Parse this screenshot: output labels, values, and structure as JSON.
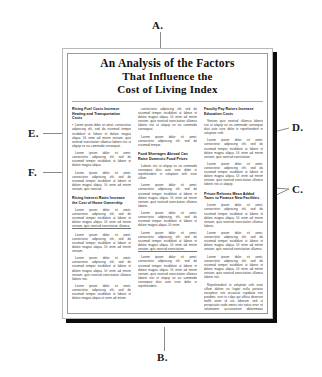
{
  "document": {
    "masthead": {
      "line1": "An Analysis of the Factors",
      "line2": "That Influence the",
      "line3": "Cost of Living Index"
    },
    "columns": [
      {
        "name": "left-column",
        "blocks": [
          {
            "heading": "Rising Fuel Costs Increase Heating and Transportation Costs",
            "paragraphs": [
              "Lorem ipsum dolor sit amet, consectetur adipiscing elit, sed do eiusmod tempor incididunt ut labore et dolore magna aliqua. Ut enim ad minim veniam, quis nostrud exercitation ullamco laboris nisi ut aliquip ex ea commodo consequat.",
              "Lorem ipsum dolor sit amet, consectetur adipiscing elit, sed do eiusmod tempor incididunt ut labore et dolore magna aliqua.",
              "Lorem ipsum dolor sit amet, consectetur adipiscing elit, sed do eiusmod tempor incididunt ut labore et dolore magna aliqua. Ut enim ad minim veniam, quis nostrud."
            ]
          },
          {
            "heading": "Rising Interest Rates Increase the Cost of Home Ownership",
            "paragraphs": [
              "Lorem ipsum dolor sit amet, consectetur adipiscing elit, sed do eiusmod tempor incididunt ut labore et dolore magna aliqua. Ut enim ad minim veniam, quis nostrud exercitation ullamco.",
              "Lorem ipsum dolor sit amet, consectetur adipiscing elit, sed do eiusmod tempor incididunt ut labore et dolore magna aliqua. Ut enim ad minim veniam.",
              "Lorem ipsum dolor sit amet, consectetur adipiscing elit, sed do eiusmod tempor incididunt ut labore et dolore magna aliqua. Ut enim ad minim veniam, quis nostrud exercitation ullamco laboris nisi.",
              "Lorem ipsum dolor sit amet, consectetur adipiscing elit, sed do eiusmod tempor incididunt ut labore et dolore magna aliqua ut enim ad minim."
            ]
          }
        ]
      },
      {
        "name": "middle-column",
        "blocks": [
          {
            "heading": "",
            "paragraphs": [
              "consectetur adipiscing elit, sed do eiusmod tempor incididunt ut labore et dolore magna aliqua. Ut enim ad minim veniam, quis nostrud exercitation ullamco laboris nisi ut aliquip ex ea commodo consequat.",
              "Lorem ipsum dolor sit amet, consectetur adipiscing elit, sed do eiusmod tempor."
            ]
          },
          {
            "heading": "Food Shortages Abroad Can Raise Domestic Food Prices",
            "paragraphs": [
              "Laboris nisi ut aliquip ex ea commodo consequat duis aute irure dolor in reprehenderit in voluptate velit esse cillum.",
              "Lorem ipsum dolor sit amet, consectetur adipiscing elit, sed do eiusmod tempor incididunt ut labore et dolore magna aliqua. Ut enim ad minim veniam, quis nostrud exercitation ullamco laboris.",
              "Lorem ipsum dolor sit amet, consectetur adipiscing elit, sed do eiusmod tempor incididunt ut labore et dolore magna aliqua. Ut enim.",
              "Lorem ipsum dolor sit amet, consectetur adipiscing elit, sed do eiusmod tempor incididunt ut labore et dolore magna aliqua. Ut enim ad minim veniam, quis nostrud exercitation.",
              "Lorem ipsum dolor sit amet, consectetur adipiscing elit, sed do eiusmod tempor incididunt ut labore et dolore magna aliqua. Ut enim ad minim veniam, quis nostrud exercitation ullamco laboris nisi ut aliquip ex ea commodo consequat duis aute irure dolor in reprehenderit."
            ]
          }
        ]
      },
      {
        "name": "right-column",
        "blocks": [
          {
            "heading": "Faculty Pay Raises Increase Education Costs",
            "paragraphs": [
              "Veniam quis nostrud ullamco laboris nisi ut aliquip ex ea commodo consequat duis aute irure dolor in reprehenderit in voluptate velit.",
              "Lorem ipsum dolor sit amet, consectetur adipiscing elit, sed do eiusmod tempor incididunt ut labore et dolore magna aliqua. Ut enim ad minim veniam, quis nostrud exercitation.",
              "Lorem ipsum dolor sit amet, consectetur adipiscing elit, sed do eiusmod tempor incididunt ut labore et dolore magna aliqua. Ut enim ad minim veniam, quis nostrud exercitation ullamco laboris nisi ut aliquip."
            ]
          },
          {
            "heading": "Prison Reforms Mean Added Taxes to Finance New Facilities",
            "paragraphs": [
              "Lorem ipsum dolor sit amet, consectetur adipiscing elit, sed do eiusmod tempor incididunt ut labore et dolore magna aliqua. Ut enim ad minim veniam, quis nostrud exercitation ullamco laboris.",
              "Lorem ipsum dolor sit amet, consectetur adipiscing elit, sed do eiusmod tempor incididunt ut labore et dolore magna aliqua. Ut enim ad minim veniam, quis nostrud exercitation ullamco.",
              "Lorem ipsum dolor sit amet, consectetur adipiscing elit, sed do eiusmod tempor incididunt ut labore et dolore magna aliqua. Ut enim ad minim veniam, quis nostrud exercitation ullamco laboris nisi.",
              "Reprehenderit in voluptate velit esse cillum dolore eu fugiat nulla pariatur excepteur sint occaecat cupidatat non proident, sunt in culpa qui officia deserunt mollit anim id est laborum sed ut perspiciatis unde omnis iste natus error sit voluptatem accusantium doloremque laudantium totam rem aperiam."
            ]
          }
        ]
      }
    ]
  },
  "callouts": [
    {
      "id": "a",
      "label": "A."
    },
    {
      "id": "b",
      "label": "B."
    },
    {
      "id": "c",
      "label": "C."
    },
    {
      "id": "d",
      "label": "D."
    },
    {
      "id": "e",
      "label": "E."
    },
    {
      "id": "f",
      "label": "F."
    }
  ],
  "colors": {
    "page": "#ffffff",
    "page_border": "#b9b9b9",
    "inner_frame": "#9a9a9a",
    "shadow": "#0d0d0d",
    "leader": "#8a8a8a",
    "text": "#111111",
    "body_text": "#3a3a3a"
  }
}
